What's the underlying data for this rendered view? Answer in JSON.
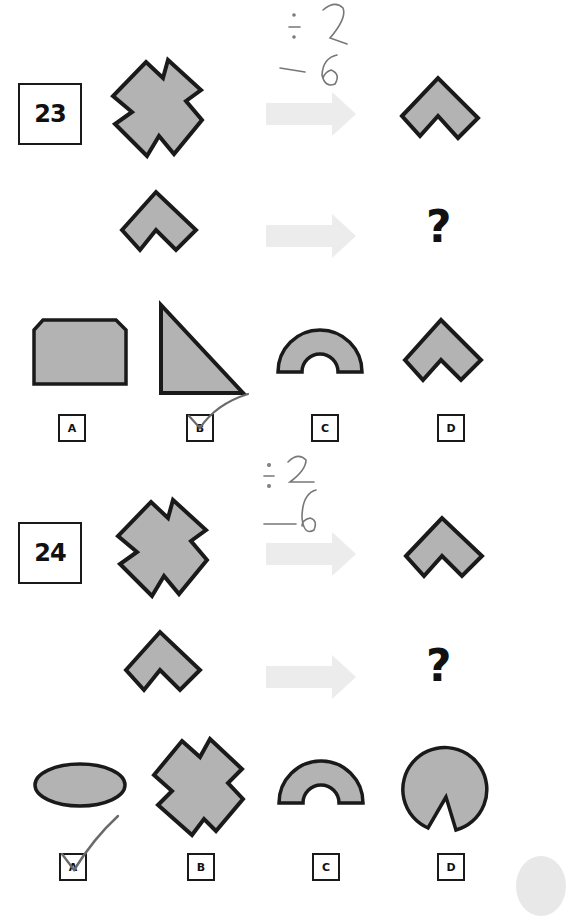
{
  "colors": {
    "shape_fill": "#b3b3b3",
    "shape_stroke": "#1a1a1a",
    "arrow": "#ececec",
    "pencil": "#6a6a6a"
  },
  "questions": [
    {
      "number": "23",
      "annotation": {
        "top": "÷2",
        "bottom": "−6"
      },
      "row1": {
        "left_shape": "cross",
        "arrow": "right-arrow",
        "right_shape": "chevron"
      },
      "row2": {
        "left_shape": "chevron",
        "arrow": "right-arrow",
        "right_shape": "?"
      },
      "options": [
        {
          "label": "A",
          "shape": "octagon-rectangle"
        },
        {
          "label": "B",
          "shape": "right-triangle",
          "checked": true
        },
        {
          "label": "C",
          "shape": "half-ring"
        },
        {
          "label": "D",
          "shape": "chevron"
        }
      ]
    },
    {
      "number": "24",
      "annotation": {
        "top": "÷2",
        "bottom": "−6"
      },
      "row1": {
        "left_shape": "cross",
        "arrow": "right-arrow",
        "right_shape": "chevron"
      },
      "row2": {
        "left_shape": "chevron",
        "arrow": "right-arrow",
        "right_shape": "?"
      },
      "options": [
        {
          "label": "A",
          "shape": "ellipse",
          "checked": true
        },
        {
          "label": "B",
          "shape": "cross"
        },
        {
          "label": "C",
          "shape": "half-ring"
        },
        {
          "label": "D",
          "shape": "pie-with-wedge"
        }
      ]
    }
  ]
}
